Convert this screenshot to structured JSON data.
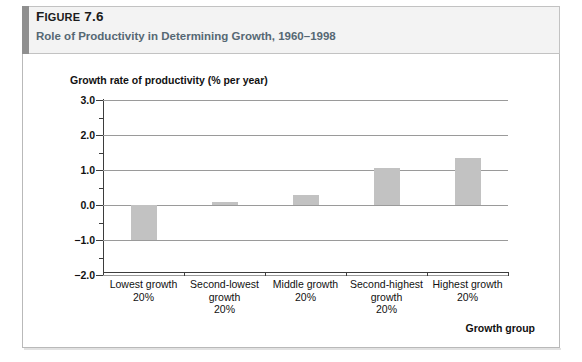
{
  "header": {
    "figure_number_prefix": "F",
    "figure_number_rest": "IGURE",
    "figure_number_value": " 7.6",
    "figure_number_full": "FIGURE 7.6",
    "title": "Role of Productivity in Determining Growth, 1960–1998",
    "accent_color": "#8f8f8f",
    "band_color": "#f3f3f3",
    "title_color": "#566874"
  },
  "chart_data": {
    "type": "bar",
    "title": "Role of Productivity in Determining Growth, 1960–1998",
    "categories": [
      "Lowest growth\n20%",
      "Second-lowest growth\n20%",
      "Middle growth\n20%",
      "Second-highest growth\n20%",
      "Highest growth\n20%"
    ],
    "category_lines": [
      [
        "Lowest growth",
        "20%"
      ],
      [
        "Second-lowest",
        "growth",
        "20%"
      ],
      [
        "Middle growth",
        "20%"
      ],
      [
        "Second-highest",
        "growth",
        "20%"
      ],
      [
        "Highest growth",
        "20%"
      ]
    ],
    "values": [
      -1.0,
      0.1,
      0.3,
      1.05,
      1.35
    ],
    "xlabel": "Growth group",
    "ylabel": "Growth rate of productivity (% per year)",
    "ylim": [
      -2.0,
      3.0
    ],
    "ytick_labels": [
      "3.0",
      "2.0",
      "1.0",
      "0.0",
      "−1.0",
      "−2.0"
    ],
    "ytick_values": [
      3.0,
      2.0,
      1.0,
      0.0,
      -1.0,
      -2.0
    ],
    "yminor_values": [
      2.5,
      1.5,
      0.5,
      -0.5,
      -1.5
    ],
    "grid": true,
    "legend": "none",
    "bar_color": "#c2c2c2",
    "axis_color": "#3d3d3d",
    "gridline_color": "#9a9a9a"
  }
}
